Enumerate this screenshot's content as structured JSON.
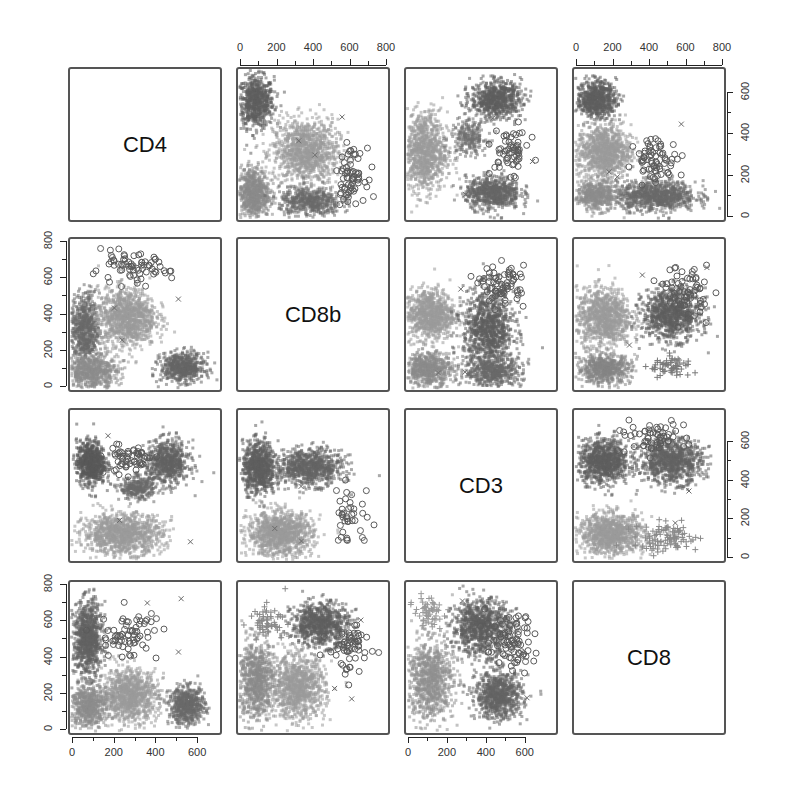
{
  "chart_data": {
    "type": "scatter",
    "title": "",
    "subtype": "scatterplot-matrix",
    "variables": [
      "CD4",
      "CD8b",
      "CD3",
      "CD8"
    ],
    "groups": [
      {
        "name": "group-1",
        "marker": "circle",
        "color": "#6e6e6e"
      },
      {
        "name": "group-2",
        "marker": "triangle",
        "color": "#a8a8a8"
      },
      {
        "name": "group-3",
        "marker": "plus",
        "color": "#9a9a9a"
      },
      {
        "name": "group-4",
        "marker": "x",
        "color": "#7a7a7a"
      }
    ],
    "axes": {
      "top": [
        {
          "column": 2,
          "ticks": [
            "0",
            "200",
            "400",
            "600",
            "800"
          ],
          "range": [
            0,
            800
          ]
        },
        {
          "column": 4,
          "ticks": [
            "0",
            "200",
            "400",
            "600",
            "800"
          ],
          "range": [
            0,
            800
          ]
        }
      ],
      "right": [
        {
          "row": 1,
          "ticks": [
            "0",
            "200",
            "400",
            "600"
          ],
          "range": [
            0,
            700
          ]
        },
        {
          "row": 3,
          "ticks": [
            "0",
            "200",
            "400",
            "600"
          ],
          "range": [
            0,
            750
          ]
        }
      ],
      "left": [
        {
          "row": 2,
          "ticks": [
            "0",
            "200",
            "400",
            "600",
            "800"
          ],
          "range": [
            0,
            800
          ]
        },
        {
          "row": 4,
          "ticks": [
            "0",
            "200",
            "400",
            "600",
            "800"
          ],
          "range": [
            0,
            800
          ]
        }
      ],
      "bottom": [
        {
          "column": 1,
          "ticks": [
            "0",
            "200",
            "400",
            "600"
          ],
          "range": [
            0,
            700
          ]
        },
        {
          "column": 3,
          "ticks": [
            "0",
            "200",
            "400",
            "600"
          ],
          "range": [
            0,
            750
          ]
        }
      ]
    },
    "panels": [
      {
        "row": 1,
        "col": 1,
        "diagonal": true,
        "label": "CD4"
      },
      {
        "row": 1,
        "col": 2,
        "x": "CD8b",
        "y": "CD4",
        "clusters": [
          {
            "cx": 0.12,
            "cy": 0.78,
            "sx": 0.1,
            "sy": 0.14,
            "n": 700,
            "shade": "#5f5f5f"
          },
          {
            "cx": 0.45,
            "cy": 0.45,
            "sx": 0.18,
            "sy": 0.18,
            "n": 1100,
            "shade": "#9a9a9a"
          },
          {
            "cx": 0.1,
            "cy": 0.18,
            "sx": 0.09,
            "sy": 0.14,
            "n": 700,
            "shade": "#8a8a8a"
          },
          {
            "cx": 0.48,
            "cy": 0.12,
            "sx": 0.17,
            "sy": 0.08,
            "n": 500,
            "shade": "#6a6a6a"
          },
          {
            "cx": 0.75,
            "cy": 0.3,
            "sx": 0.08,
            "sy": 0.14,
            "n": 70,
            "shade": "#5a5a5a",
            "open": true
          }
        ]
      },
      {
        "row": 1,
        "col": 3,
        "x": "CD3",
        "y": "CD4",
        "clusters": [
          {
            "cx": 0.6,
            "cy": 0.8,
            "sx": 0.14,
            "sy": 0.1,
            "n": 700,
            "shade": "#5f5f5f"
          },
          {
            "cx": 0.12,
            "cy": 0.45,
            "sx": 0.13,
            "sy": 0.22,
            "n": 1000,
            "shade": "#9a9a9a"
          },
          {
            "cx": 0.58,
            "cy": 0.18,
            "sx": 0.15,
            "sy": 0.09,
            "n": 700,
            "shade": "#666666"
          },
          {
            "cx": 0.42,
            "cy": 0.55,
            "sx": 0.1,
            "sy": 0.1,
            "n": 250,
            "shade": "#6f6f6f"
          },
          {
            "cx": 0.7,
            "cy": 0.45,
            "sx": 0.1,
            "sy": 0.12,
            "n": 60,
            "shade": "#5a5a5a",
            "open": true
          }
        ]
      },
      {
        "row": 1,
        "col": 4,
        "x": "CD8",
        "y": "CD4",
        "clusters": [
          {
            "cx": 0.15,
            "cy": 0.8,
            "sx": 0.11,
            "sy": 0.1,
            "n": 700,
            "shade": "#5f5f5f"
          },
          {
            "cx": 0.2,
            "cy": 0.45,
            "sx": 0.15,
            "sy": 0.15,
            "n": 1000,
            "shade": "#9a9a9a"
          },
          {
            "cx": 0.55,
            "cy": 0.16,
            "sx": 0.22,
            "sy": 0.08,
            "n": 900,
            "shade": "#6a6a6a"
          },
          {
            "cx": 0.15,
            "cy": 0.16,
            "sx": 0.12,
            "sy": 0.08,
            "n": 500,
            "shade": "#8d8d8d"
          },
          {
            "cx": 0.55,
            "cy": 0.4,
            "sx": 0.12,
            "sy": 0.12,
            "n": 70,
            "shade": "#5a5a5a",
            "open": true
          }
        ]
      },
      {
        "row": 2,
        "col": 1,
        "x": "CD4",
        "y": "CD8b",
        "clusters": [
          {
            "cx": 0.1,
            "cy": 0.4,
            "sx": 0.08,
            "sy": 0.2,
            "n": 700,
            "shade": "#6a6a6a"
          },
          {
            "cx": 0.38,
            "cy": 0.48,
            "sx": 0.16,
            "sy": 0.16,
            "n": 1100,
            "shade": "#9a9a9a"
          },
          {
            "cx": 0.75,
            "cy": 0.15,
            "sx": 0.12,
            "sy": 0.08,
            "n": 600,
            "shade": "#666666"
          },
          {
            "cx": 0.15,
            "cy": 0.12,
            "sx": 0.14,
            "sy": 0.09,
            "n": 600,
            "shade": "#8d8d8d"
          },
          {
            "cx": 0.4,
            "cy": 0.8,
            "sx": 0.22,
            "sy": 0.08,
            "n": 70,
            "shade": "#5a5a5a",
            "open": true
          }
        ]
      },
      {
        "row": 2,
        "col": 2,
        "diagonal": true,
        "label": "CD8b"
      },
      {
        "row": 2,
        "col": 3,
        "x": "CD3",
        "y": "CD8b",
        "clusters": [
          {
            "cx": 0.16,
            "cy": 0.5,
            "sx": 0.14,
            "sy": 0.14,
            "n": 900,
            "shade": "#9a9a9a"
          },
          {
            "cx": 0.55,
            "cy": 0.4,
            "sx": 0.14,
            "sy": 0.22,
            "n": 1000,
            "shade": "#5f5f5f"
          },
          {
            "cx": 0.15,
            "cy": 0.14,
            "sx": 0.13,
            "sy": 0.09,
            "n": 600,
            "shade": "#8a8a8a"
          },
          {
            "cx": 0.58,
            "cy": 0.12,
            "sx": 0.16,
            "sy": 0.08,
            "n": 500,
            "shade": "#6a6a6a"
          },
          {
            "cx": 0.65,
            "cy": 0.7,
            "sx": 0.12,
            "sy": 0.1,
            "n": 70,
            "shade": "#5a5a5a",
            "open": true
          }
        ]
      },
      {
        "row": 2,
        "col": 4,
        "x": "CD8",
        "y": "CD8b",
        "clusters": [
          {
            "cx": 0.2,
            "cy": 0.48,
            "sx": 0.15,
            "sy": 0.16,
            "n": 1000,
            "shade": "#9a9a9a"
          },
          {
            "cx": 0.65,
            "cy": 0.5,
            "sx": 0.16,
            "sy": 0.14,
            "n": 900,
            "shade": "#5f5f5f"
          },
          {
            "cx": 0.2,
            "cy": 0.14,
            "sx": 0.15,
            "sy": 0.08,
            "n": 600,
            "shade": "#858585"
          },
          {
            "cx": 0.65,
            "cy": 0.15,
            "sx": 0.12,
            "sy": 0.06,
            "n": 60,
            "shade": "#7a7a7a",
            "plus": true
          },
          {
            "cx": 0.75,
            "cy": 0.65,
            "sx": 0.12,
            "sy": 0.14,
            "n": 70,
            "shade": "#5a5a5a",
            "open": true
          }
        ]
      },
      {
        "row": 3,
        "col": 1,
        "x": "CD4",
        "y": "CD3",
        "clusters": [
          {
            "cx": 0.14,
            "cy": 0.65,
            "sx": 0.08,
            "sy": 0.12,
            "n": 700,
            "shade": "#5a5a5a"
          },
          {
            "cx": 0.65,
            "cy": 0.65,
            "sx": 0.12,
            "sy": 0.12,
            "n": 700,
            "shade": "#626262"
          },
          {
            "cx": 0.35,
            "cy": 0.18,
            "sx": 0.22,
            "sy": 0.11,
            "n": 1100,
            "shade": "#9a9a9a"
          },
          {
            "cx": 0.45,
            "cy": 0.48,
            "sx": 0.1,
            "sy": 0.06,
            "n": 300,
            "shade": "#6a6a6a"
          },
          {
            "cx": 0.4,
            "cy": 0.68,
            "sx": 0.14,
            "sy": 0.09,
            "n": 60,
            "shade": "#5a5a5a",
            "open": true
          }
        ]
      },
      {
        "row": 3,
        "col": 2,
        "x": "CD8b",
        "y": "CD3",
        "clusters": [
          {
            "cx": 0.14,
            "cy": 0.62,
            "sx": 0.09,
            "sy": 0.14,
            "n": 800,
            "shade": "#5f5f5f"
          },
          {
            "cx": 0.48,
            "cy": 0.62,
            "sx": 0.18,
            "sy": 0.1,
            "n": 800,
            "shade": "#646464"
          },
          {
            "cx": 0.28,
            "cy": 0.18,
            "sx": 0.18,
            "sy": 0.12,
            "n": 1100,
            "shade": "#9a9a9a"
          },
          {
            "cx": 0.75,
            "cy": 0.3,
            "sx": 0.12,
            "sy": 0.18,
            "n": 40,
            "shade": "#5a5a5a",
            "open": true
          }
        ]
      },
      {
        "row": 3,
        "col": 3,
        "diagonal": true,
        "label": "CD3"
      },
      {
        "row": 3,
        "col": 4,
        "x": "CD8",
        "y": "CD3",
        "clusters": [
          {
            "cx": 0.2,
            "cy": 0.66,
            "sx": 0.14,
            "sy": 0.12,
            "n": 900,
            "shade": "#5f5f5f"
          },
          {
            "cx": 0.65,
            "cy": 0.66,
            "sx": 0.17,
            "sy": 0.12,
            "n": 900,
            "shade": "#636363"
          },
          {
            "cx": 0.25,
            "cy": 0.18,
            "sx": 0.18,
            "sy": 0.11,
            "n": 1000,
            "shade": "#9a9a9a"
          },
          {
            "cx": 0.62,
            "cy": 0.15,
            "sx": 0.18,
            "sy": 0.08,
            "n": 100,
            "shade": "#8a8a8a",
            "plus": true
          },
          {
            "cx": 0.5,
            "cy": 0.82,
            "sx": 0.2,
            "sy": 0.08,
            "n": 60,
            "shade": "#5a5a5a",
            "open": true
          }
        ]
      },
      {
        "row": 4,
        "col": 1,
        "x": "CD4",
        "y": "CD8",
        "clusters": [
          {
            "cx": 0.12,
            "cy": 0.62,
            "sx": 0.08,
            "sy": 0.2,
            "n": 900,
            "shade": "#636363"
          },
          {
            "cx": 0.4,
            "cy": 0.25,
            "sx": 0.15,
            "sy": 0.14,
            "n": 1000,
            "shade": "#9a9a9a"
          },
          {
            "cx": 0.78,
            "cy": 0.18,
            "sx": 0.1,
            "sy": 0.1,
            "n": 600,
            "shade": "#6a6a6a"
          },
          {
            "cx": 0.12,
            "cy": 0.18,
            "sx": 0.1,
            "sy": 0.12,
            "n": 600,
            "shade": "#8d8d8d"
          },
          {
            "cx": 0.4,
            "cy": 0.65,
            "sx": 0.16,
            "sy": 0.14,
            "n": 70,
            "shade": "#5a5a5a",
            "open": true
          }
        ]
      },
      {
        "row": 4,
        "col": 2,
        "x": "CD8b",
        "y": "CD8",
        "clusters": [
          {
            "cx": 0.55,
            "cy": 0.72,
            "sx": 0.16,
            "sy": 0.12,
            "n": 800,
            "shade": "#5f5f5f"
          },
          {
            "cx": 0.4,
            "cy": 0.3,
            "sx": 0.15,
            "sy": 0.17,
            "n": 1000,
            "shade": "#9a9a9a"
          },
          {
            "cx": 0.12,
            "cy": 0.35,
            "sx": 0.1,
            "sy": 0.22,
            "n": 800,
            "shade": "#8a8a8a"
          },
          {
            "cx": 0.2,
            "cy": 0.75,
            "sx": 0.1,
            "sy": 0.08,
            "n": 60,
            "shade": "#8a8a8a",
            "plus": true
          },
          {
            "cx": 0.75,
            "cy": 0.55,
            "sx": 0.12,
            "sy": 0.14,
            "n": 60,
            "shade": "#5a5a5a",
            "open": true
          }
        ]
      },
      {
        "row": 4,
        "col": 3,
        "x": "CD3",
        "y": "CD8",
        "clusters": [
          {
            "cx": 0.5,
            "cy": 0.7,
            "sx": 0.16,
            "sy": 0.15,
            "n": 900,
            "shade": "#5f5f5f"
          },
          {
            "cx": 0.62,
            "cy": 0.25,
            "sx": 0.13,
            "sy": 0.13,
            "n": 800,
            "shade": "#646464"
          },
          {
            "cx": 0.16,
            "cy": 0.35,
            "sx": 0.13,
            "sy": 0.22,
            "n": 900,
            "shade": "#8f8f8f"
          },
          {
            "cx": 0.15,
            "cy": 0.8,
            "sx": 0.08,
            "sy": 0.08,
            "n": 60,
            "shade": "#9a9a9a",
            "plus": true
          },
          {
            "cx": 0.7,
            "cy": 0.6,
            "sx": 0.14,
            "sy": 0.16,
            "n": 80,
            "shade": "#5a5a5a",
            "open": true
          }
        ]
      },
      {
        "row": 4,
        "col": 4,
        "diagonal": true,
        "label": "CD8"
      }
    ],
    "grid": false,
    "legend": null
  },
  "diagonal_labels": {
    "p11": "CD4",
    "p22": "CD8b",
    "p33": "CD3",
    "p44": "CD8"
  },
  "tick_labels": {
    "top_col2": [
      "0",
      "200",
      "400",
      "600",
      "800"
    ],
    "top_col4": [
      "0",
      "200",
      "400",
      "600",
      "800"
    ],
    "right_row1": [
      "0",
      "200",
      "400",
      "600"
    ],
    "right_row3": [
      "0",
      "200",
      "400",
      "600"
    ],
    "left_row2": [
      "0",
      "200",
      "400",
      "600",
      "800"
    ],
    "left_row4": [
      "0",
      "200",
      "400",
      "600",
      "800"
    ],
    "bottom_col1": [
      "0",
      "200",
      "400",
      "600"
    ],
    "bottom_col3": [
      "0",
      "200",
      "400",
      "600"
    ]
  }
}
